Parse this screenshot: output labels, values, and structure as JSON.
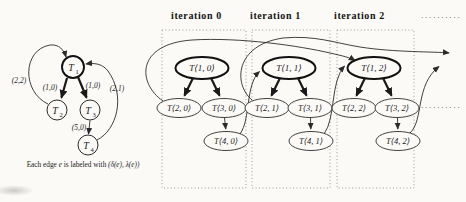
{
  "figure": {
    "left": {
      "nodes": [
        {
          "base": "T",
          "sub": "1"
        },
        {
          "base": "T",
          "sub": "2"
        },
        {
          "base": "T",
          "sub": "3"
        },
        {
          "base": "T",
          "sub": "4"
        }
      ],
      "edge_labels": {
        "t2_to_t1": "(2,2)",
        "t1_to_t2": "(1,0)",
        "t1_to_t3": "(1,0)",
        "t4_to_t1": "(2,1)",
        "t3_to_t4": "(5,0)"
      },
      "caption": {
        "prefix": "Each edge",
        "var": "e",
        "middle": "is labeled with",
        "formula": "(δ(e), λ(e))"
      }
    },
    "unrolled": {
      "iterations": [
        {
          "label": "iteration 0",
          "nodes": [
            "T⟨1, 0⟩",
            "T⟨2, 0⟩",
            "T⟨3, 0⟩",
            "T⟨4, 0⟩"
          ]
        },
        {
          "label": "iteration 1",
          "nodes": [
            "T⟨1, 1⟩",
            "T⟨2, 1⟩",
            "T⟨3, 1⟩",
            "T⟨4, 1⟩"
          ]
        },
        {
          "label": "iteration 2",
          "nodes": [
            "T⟨1, 2⟩",
            "T⟨2, 2⟩",
            "T⟨3, 2⟩",
            "T⟨4, 2⟩"
          ]
        }
      ],
      "continuation_dots_top": "..........",
      "continuation_dots_mid": ".........."
    },
    "colors": {
      "background": "#fbfaf7",
      "line": "#2b2b2b",
      "box_border": "#8f8f8f",
      "text": "#1c1c1c"
    }
  }
}
